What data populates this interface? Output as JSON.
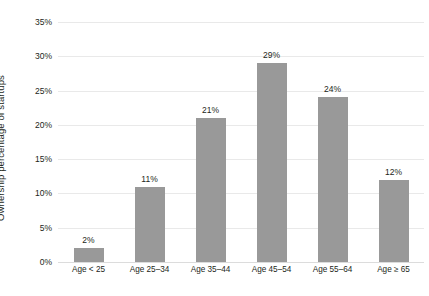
{
  "chart_data": {
    "type": "bar",
    "title": "",
    "subtitle": "",
    "xlabel": "",
    "ylabel": "Ownership percentage of startups",
    "categories": [
      "Age < 25",
      "Age 25–34",
      "Age 35–44",
      "Age 45–54",
      "Age 55–64",
      "Age ≥ 65"
    ],
    "values": [
      2,
      11,
      21,
      29,
      24,
      12
    ],
    "data_labels": [
      "2%",
      "11%",
      "21%",
      "29%",
      "24%",
      "12%"
    ],
    "ylim": [
      0,
      35
    ],
    "ytick_values": [
      0,
      5,
      10,
      15,
      20,
      25,
      30,
      35
    ],
    "ytick_labels": [
      "0%",
      "5%",
      "10%",
      "15%",
      "20%",
      "25%",
      "30%",
      "35%"
    ],
    "grid": true,
    "grid_axis": "y",
    "legend": false,
    "legend_position": "none",
    "bar_color": "#999999",
    "grid_color": "#e9e9e9",
    "background_color": "#ffffff",
    "text_color": "#231f20"
  }
}
